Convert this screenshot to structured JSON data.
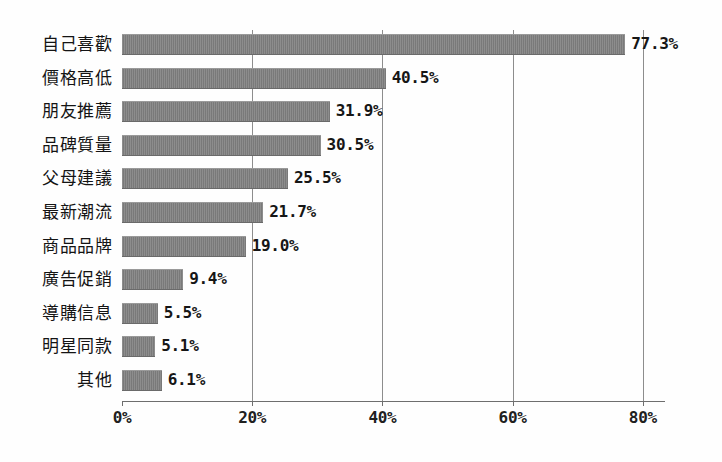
{
  "chart_data": {
    "type": "bar",
    "orientation": "horizontal",
    "title": "",
    "xlabel": "",
    "ylabel": "",
    "xlim": [
      0,
      85
    ],
    "grid": true,
    "legend": null,
    "categories": [
      "自己喜歡",
      "價格高低",
      "朋友推薦",
      "品碑質量",
      "父母建議",
      "最新潮流",
      "商品品牌",
      "廣告促銷",
      "導購信息",
      "明星同款",
      "其他"
    ],
    "values": [
      77.3,
      40.5,
      31.9,
      30.5,
      25.5,
      21.7,
      19.0,
      9.4,
      5.5,
      5.1,
      6.1
    ],
    "value_labels": [
      "77.3%",
      "40.5%",
      "31.9%",
      "30.5%",
      "25.5%",
      "21.7%",
      "19.0%",
      "9.4%",
      "5.5%",
      "5.1%",
      "6.1%"
    ],
    "xticks": [
      0,
      20,
      40,
      60,
      80
    ],
    "xtick_labels": [
      "0%",
      "20%",
      "40%",
      "60%",
      "80%"
    ],
    "bar_color": "#808080",
    "gridline_color": "#8d8d8d",
    "axis_color": "#6e6e6e",
    "background_color": "#fefefe"
  },
  "footer": {
    "note": ""
  }
}
